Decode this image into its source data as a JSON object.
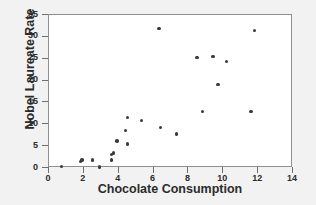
{
  "chart_data": {
    "type": "scatter",
    "title": "",
    "xlabel": "Chocolate Consumption",
    "ylabel": "Nobel Laureate Rate",
    "xlim": [
      0,
      14
    ],
    "ylim": [
      0,
      35
    ],
    "xticks": [
      0,
      2,
      4,
      6,
      8,
      10,
      12,
      14
    ],
    "yticks": [
      0,
      5,
      10,
      15,
      20,
      25,
      30,
      35
    ],
    "grid": false,
    "legend": null,
    "marker_color": "#3a3a3a",
    "plot_background": "#ffffff",
    "figure_background": "#f2f2f2",
    "points": [
      {
        "x": 0.7,
        "y": 0.3
      },
      {
        "x": 1.8,
        "y": 1.5
      },
      {
        "x": 1.9,
        "y": 1.8
      },
      {
        "x": 2.5,
        "y": 1.8
      },
      {
        "x": 2.9,
        "y": 0.2
      },
      {
        "x": 3.6,
        "y": 1.8
      },
      {
        "x": 3.6,
        "y": 3.1
      },
      {
        "x": 3.7,
        "y": 3.4
      },
      {
        "x": 3.9,
        "y": 6.2
      },
      {
        "x": 4.4,
        "y": 8.6
      },
      {
        "x": 4.5,
        "y": 11.6
      },
      {
        "x": 4.5,
        "y": 5.5
      },
      {
        "x": 5.3,
        "y": 10.8
      },
      {
        "x": 6.3,
        "y": 31.9
      },
      {
        "x": 6.4,
        "y": 9.2
      },
      {
        "x": 7.3,
        "y": 7.8
      },
      {
        "x": 8.5,
        "y": 25.3
      },
      {
        "x": 8.8,
        "y": 12.9
      },
      {
        "x": 9.4,
        "y": 25.5
      },
      {
        "x": 9.7,
        "y": 19.1
      },
      {
        "x": 10.2,
        "y": 24.3
      },
      {
        "x": 11.6,
        "y": 12.9
      },
      {
        "x": 11.8,
        "y": 31.5
      }
    ]
  }
}
